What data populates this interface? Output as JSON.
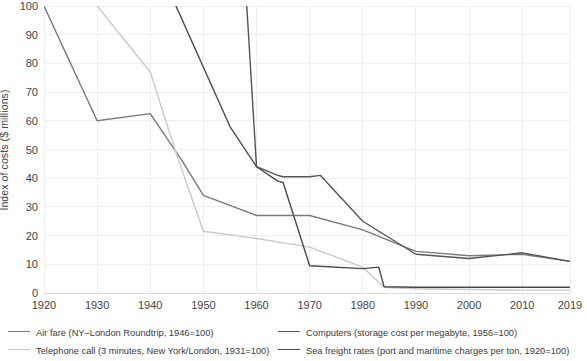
{
  "chart_data": {
    "type": "line",
    "title": "",
    "xlabel": "",
    "ylabel": "Index of costs ($ millions)",
    "xlim": [
      1920,
      2019
    ],
    "ylim": [
      0,
      100
    ],
    "grid": true,
    "legend_position": "bottom",
    "y_ticks": [
      "0",
      "10",
      "20",
      "30",
      "40",
      "50",
      "60",
      "70",
      "80",
      "90",
      "100"
    ],
    "x_ticks": [
      "1920",
      "1930",
      "1940",
      "1950",
      "1960",
      "1970",
      "1980",
      "1990",
      "2000",
      "2010",
      "2019"
    ],
    "series": [
      {
        "name": "Air fare (NY–London Roundtrip, 1946=100)",
        "short": "air-fare",
        "color": "#7a7a7a",
        "x": [
          1920,
          1930,
          1940,
          1946,
          1950,
          1960,
          1970,
          1980,
          1990,
          2000,
          2010,
          2019
        ],
        "y": [
          100,
          60,
          62.5,
          46,
          34,
          27,
          27,
          22,
          14.5,
          13,
          13.5,
          11
        ]
      },
      {
        "name": "Telephone call (3 minutes, New York/London, 1931=100)",
        "short": "telephone-call",
        "color": "#c9c9c9",
        "x": [
          1930,
          1940,
          1945,
          1950,
          1960,
          1970,
          1980,
          1984,
          1990,
          2000,
          2010,
          2019
        ],
        "y": [
          100,
          77,
          48,
          21.5,
          19,
          16,
          9,
          2,
          1.5,
          1.2,
          1,
          1
        ]
      },
      {
        "name": "Computers (storage cost per megabyte, 1956=100)",
        "short": "computers",
        "color": "#545454",
        "x": [
          1956,
          1958,
          1960,
          1964,
          1965,
          1970,
          1972,
          1980,
          1990,
          2000,
          2010,
          2019
        ],
        "y": [
          190,
          105,
          44,
          41,
          40.5,
          40.5,
          41,
          25,
          13.5,
          12,
          14,
          11
        ]
      },
      {
        "name": "Sea freight rates (port and maritime charges per ton, 1920=100)",
        "short": "sea-freight",
        "color": "#4a4a4a",
        "x": [
          1920,
          1940,
          1955,
          1960,
          1964,
          1965,
          1970,
          1980,
          1983,
          1984,
          1990,
          2000,
          2010,
          2019
        ],
        "y": [
          165,
          120,
          58,
          44,
          39,
          38.5,
          9.5,
          8.5,
          9,
          2.2,
          2,
          2,
          2,
          2
        ]
      }
    ]
  },
  "legend": {
    "items": [
      {
        "label": "Air fare (NY–London Roundtrip, 1946=100)",
        "color": "#7a7a7a"
      },
      {
        "label": "Telephone call (3 minutes, New York/London, 1931=100)",
        "color": "#c9c9c9"
      },
      {
        "label": "Computers (storage cost per megabyte, 1956=100)",
        "color": "#545454"
      },
      {
        "label": "Sea freight rates (port and maritime charges per ton, 1920=100)",
        "color": "#4a4a4a"
      }
    ]
  },
  "axes": {
    "y_axis_label": "Index of costs ($ millions)"
  },
  "colors": {
    "grid": "#eeeeee",
    "axis_text": "#444444",
    "background": "#ffffff"
  }
}
